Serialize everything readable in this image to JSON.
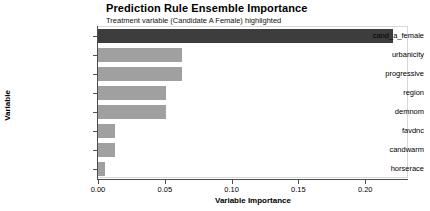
{
  "chart_data": {
    "type": "bar",
    "orientation": "horizontal",
    "title": "Prediction Rule Ensemble Importance",
    "subtitle": "Treatment variable (Candidate A Female) highlighted",
    "xlabel": "Variable Importance",
    "ylabel": "Variable",
    "categories": [
      "cand_a_female",
      "urbanicity",
      "progressive",
      "region",
      "demnom",
      "favdnc",
      "candwarm",
      "horserace"
    ],
    "values": [
      0.221,
      0.063,
      0.063,
      0.051,
      0.051,
      0.013,
      0.013,
      0.005
    ],
    "highlighted": [
      "cand_a_female"
    ],
    "xlim": [
      0.0,
      0.232
    ],
    "xticks": [
      0.0,
      0.05,
      0.1,
      0.15,
      0.2
    ],
    "xtick_labels": [
      "0.00",
      "0.05",
      "0.10",
      "0.15",
      "0.20"
    ],
    "grid": false,
    "legend": "none",
    "colors": {
      "bar": "#a0a0a0",
      "bar_highlight": "#3d3d3d",
      "axis": "#4d4d4d",
      "panel_border": "#d8d8d8",
      "background": "#ffffff",
      "text": "#000000"
    }
  }
}
